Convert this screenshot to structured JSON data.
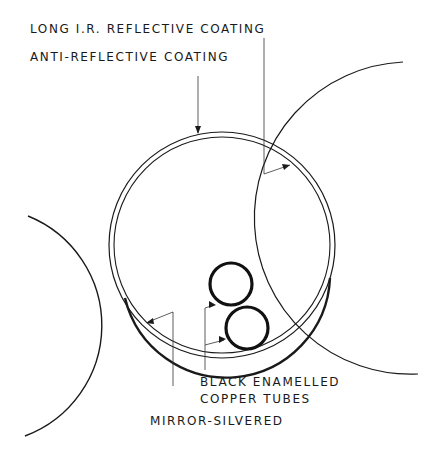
{
  "diagram": {
    "labels": {
      "ir_coating": "LONG I.R. REFLECTIVE COATING",
      "ar_coating": "ANTI-REFLECTIVE COATING",
      "tubes_line1": "BLACK ENAMELLED",
      "tubes_line2": "COPPER TUBES",
      "mirror": "MIRROR-SILVERED"
    },
    "colors": {
      "ink": "#1a1a1a",
      "background": "#ffffff"
    }
  }
}
